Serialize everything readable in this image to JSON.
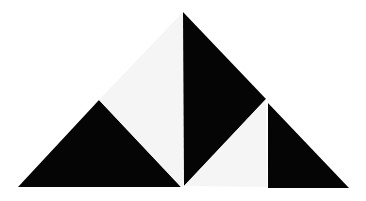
{
  "figure": {
    "background": "#ffffff",
    "colors": {
      "dark": "#050505",
      "light": "#f5f5f5"
    },
    "shapes": [
      {
        "name": "left-black-triangle",
        "fill": "dark",
        "points": "18,187 99,100 181,187"
      },
      {
        "name": "upper-light-triangle",
        "fill": "light",
        "points": "99,100 183,12 183,187 181,187"
      },
      {
        "name": "middle-black-triangle",
        "fill": "dark",
        "points": "183,12 266,99 184,186"
      },
      {
        "name": "lower-light-triangle",
        "fill": "light",
        "points": "184,186 266,99 267,187"
      },
      {
        "name": "right-black-triangle",
        "fill": "dark",
        "points": "268,103 268,188 349,188"
      }
    ]
  }
}
